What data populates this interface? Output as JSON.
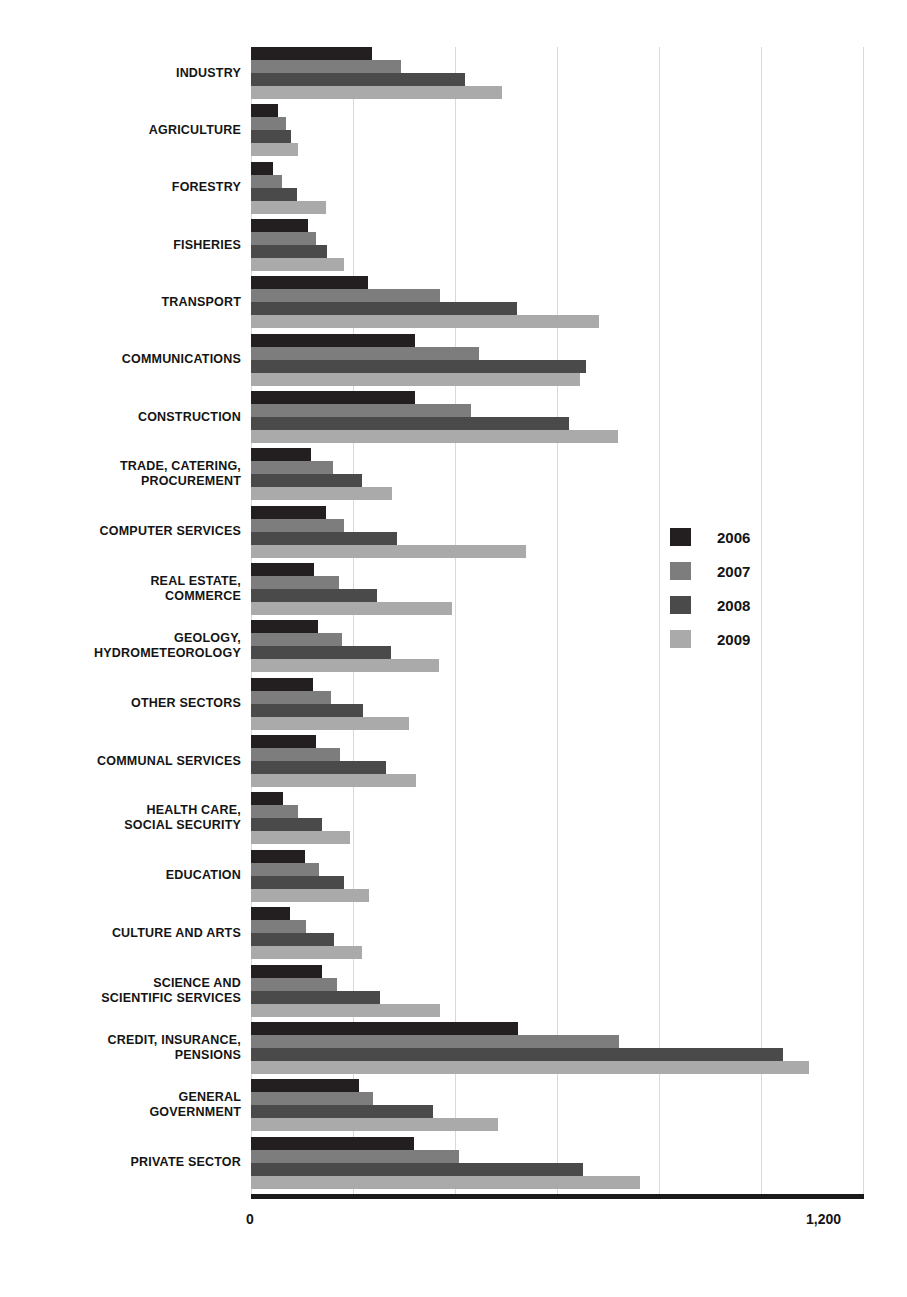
{
  "chart_data": {
    "type": "bar",
    "orientation": "horizontal",
    "title": "",
    "subtitle": "",
    "xlabel": "",
    "ylabel": "",
    "xlim": [
      0,
      1200
    ],
    "grid": true,
    "gridlines": [
      0,
      200,
      400,
      600,
      800,
      1000,
      1200
    ],
    "tick_labels": [
      "0",
      "1,200"
    ],
    "legend_position": "right-middle",
    "legend": [
      "2006",
      "2007",
      "2008",
      "2009"
    ],
    "colors": {
      "2006": "#231f20",
      "2007": "#7d7d7d",
      "2008": "#4a4a4a",
      "2009": "#aaaaaa"
    },
    "categories": [
      "INDUSTRY",
      "AGRICULTURE",
      "FORESTRY",
      "FISHERIES",
      "TRANSPORT",
      "COMMUNICATIONS",
      "CONSTRUCTION",
      "TRADE, CATERING, PROCUREMENT",
      "COMPUTER SERVICES",
      "REAL ESTATE, COMMERCE",
      "GEOLOGY, HYDROMETEOROLOGY",
      "OTHER SECTORS",
      "COMMUNAL SERVICES",
      "HEALTH CARE, SOCIAL SECURITY",
      "EDUCATION",
      "CULTURE AND ARTS",
      "SCIENCE AND SCIENTIFIC SERVICES",
      "CREDIT, INSURANCE, PENSIONS",
      "GENERAL GOVERNMENT",
      "PRIVATE SECTOR"
    ],
    "series": [
      {
        "name": "2006",
        "values": [
          238,
          53,
          44,
          112,
          230,
          322,
          321,
          118,
          147,
          124,
          132,
          122,
          128,
          62,
          106,
          77,
          139,
          523,
          211,
          320
        ]
      },
      {
        "name": "2007",
        "values": [
          294,
          69,
          60,
          128,
          370,
          447,
          432,
          160,
          183,
          173,
          178,
          157,
          174,
          93,
          134,
          108,
          168,
          721,
          240,
          407
        ]
      },
      {
        "name": "2008",
        "values": [
          420,
          79,
          91,
          149,
          522,
          656,
          624,
          217,
          287,
          248,
          274,
          219,
          264,
          139,
          183,
          162,
          252,
          1043,
          357,
          651
        ]
      },
      {
        "name": "2009",
        "values": [
          492,
          92,
          147,
          183,
          682,
          645,
          719,
          277,
          540,
          395,
          368,
          310,
          323,
          194,
          232,
          217,
          370,
          1095,
          484,
          763
        ]
      }
    ]
  },
  "rows": [
    {
      "label_lines": [
        "INDUSTRY"
      ]
    },
    {
      "label_lines": [
        "AGRICULTURE"
      ]
    },
    {
      "label_lines": [
        "FORESTRY"
      ]
    },
    {
      "label_lines": [
        "FISHERIES"
      ]
    },
    {
      "label_lines": [
        "TRANSPORT"
      ]
    },
    {
      "label_lines": [
        "COMMUNICATIONS"
      ]
    },
    {
      "label_lines": [
        "CONSTRUCTION"
      ]
    },
    {
      "label_lines": [
        "TRADE, CATERING,",
        "PROCUREMENT"
      ]
    },
    {
      "label_lines": [
        "COMPUTER SERVICES"
      ]
    },
    {
      "label_lines": [
        "REAL ESTATE,",
        "COMMERCE"
      ]
    },
    {
      "label_lines": [
        "GEOLOGY,",
        "HYDROMETEOROLOGY"
      ]
    },
    {
      "label_lines": [
        "OTHER SECTORS"
      ]
    },
    {
      "label_lines": [
        "COMMUNAL SERVICES"
      ]
    },
    {
      "label_lines": [
        "HEALTH CARE,",
        "SOCIAL SECURITY"
      ]
    },
    {
      "label_lines": [
        "EDUCATION"
      ]
    },
    {
      "label_lines": [
        "CULTURE AND ARTS"
      ]
    },
    {
      "label_lines": [
        "SCIENCE AND",
        "SCIENTIFIC SERVICES"
      ]
    },
    {
      "label_lines": [
        "CREDIT, INSURANCE,",
        "PENSIONS"
      ]
    },
    {
      "label_lines": [
        "GENERAL",
        "GOVERNMENT"
      ]
    },
    {
      "label_lines": [
        "PRIVATE SECTOR"
      ]
    }
  ],
  "axis": {
    "min_label": "0",
    "max_label": "1,200"
  },
  "caption": ""
}
